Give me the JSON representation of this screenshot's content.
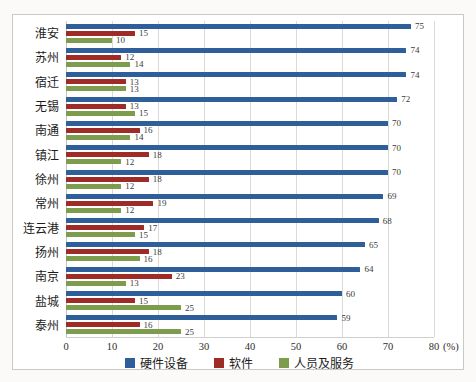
{
  "chart_data": {
    "type": "bar",
    "orientation": "horizontal",
    "title": "",
    "xlabel": "(%)",
    "ylabel": "",
    "xlim": [
      0,
      80
    ],
    "xticks": [
      0,
      10,
      20,
      30,
      40,
      50,
      60,
      70,
      80
    ],
    "grid": true,
    "legend_position": "bottom",
    "categories": [
      "淮安",
      "苏州",
      "宿迁",
      "无锡",
      "南通",
      "镇江",
      "徐州",
      "常州",
      "连云港",
      "扬州",
      "南京",
      "盐城",
      "泰州"
    ],
    "series": [
      {
        "name": "硬件设备",
        "color": "#2f5f9b",
        "values": [
          75,
          74,
          74,
          72,
          70,
          70,
          70,
          69,
          68,
          65,
          64,
          60,
          59
        ]
      },
      {
        "name": "软件",
        "color": "#9e2b26",
        "values": [
          15,
          12,
          13,
          13,
          16,
          18,
          18,
          19,
          17,
          18,
          23,
          15,
          16
        ]
      },
      {
        "name": "人员及服务",
        "color": "#7e9c4d",
        "values": [
          10,
          14,
          13,
          15,
          14,
          12,
          12,
          12,
          15,
          16,
          13,
          25,
          25
        ]
      }
    ],
    "colors": {
      "gridline": "#d9d9d6",
      "axis_line": "#cfcfcd",
      "frame_border": "#c9c9c6",
      "value_label": "#3a3a3a"
    }
  }
}
